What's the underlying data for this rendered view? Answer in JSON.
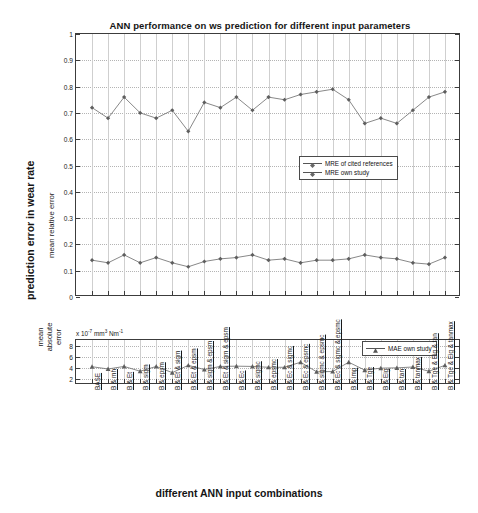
{
  "figure": {
    "title": "ANN performance on ws prediction for different input parameters",
    "xlabel": "different ANN input combinations",
    "ylabel_outer": "prediction error in wear rate",
    "ylabel_top": "mean relative error",
    "ylabel_bottom": "mean\nabsolute\nerror",
    "ylabel_bottom_line1": "mean",
    "ylabel_bottom_line2": "absolute",
    "ylabel_bottom_line3": "error",
    "sci_prefix": "x 10",
    "sci_exp": "-7",
    "sci_unit_a": "mm",
    "sci_unit_a_exp": "3",
    "sci_unit_b": "Nm",
    "sci_unit_b_exp": "-1"
  },
  "legend_top": {
    "items": [
      {
        "label": "MRE of cited references",
        "marker": "diamond",
        "color": "#666666"
      },
      {
        "label": "MRE own study",
        "marker": "diamond",
        "color": "#666666"
      }
    ]
  },
  "legend_bottom": {
    "items": [
      {
        "label": "MAE own study",
        "marker": "triangle",
        "color": "#555555"
      }
    ]
  },
  "axes": {
    "top": {
      "yticks": [
        "0",
        "0.1",
        "0.2",
        "0.3",
        "0.4",
        "0.5",
        "0.6",
        "0.7",
        "0.8",
        "0.9",
        "1"
      ],
      "ylim": [
        0,
        1
      ],
      "grid": true
    },
    "bottom": {
      "yticks": [
        "2",
        "4",
        "6",
        "8"
      ],
      "ylim": [
        1,
        9
      ],
      "grid": true
    }
  },
  "chart_data": {
    "type": "line",
    "title": "ANN performance on ws prediction for different input parameters",
    "xlabel": "different ANN input combinations",
    "ylabel": "prediction error in wear rate",
    "grid": true,
    "legend_position": "inside-right",
    "categories": [
      "BASE",
      "B & mh",
      "B & Et",
      "B & sigm",
      "B & epsm",
      "B & Et & sigm",
      "B & Et & epsm",
      "B & sigm & epsm",
      "B & Et & sigm & epsm",
      "B & Ec",
      "B & sigmc",
      "B & epsmc",
      "B & Ec & sigmc",
      "B & Ec & epsmc",
      "B & sigmc & epsmc",
      "B & Ec & sigmc & epsmc",
      "B & imp",
      "B & Tge",
      "B & Eig",
      "B & tan",
      "B & tanmax",
      "B & Tge & Eig & tan",
      "B & Tge & Eig & tanmax"
    ],
    "panels": [
      {
        "name": "mean relative error",
        "ylabel": "mean relative error",
        "ylim": [
          0,
          1
        ],
        "yticks": [
          0,
          0.1,
          0.2,
          0.3,
          0.4,
          0.5,
          0.6,
          0.7,
          0.8,
          0.9,
          1
        ],
        "series": [
          {
            "name": "MRE of cited references",
            "values": [
              0.72,
              0.68,
              0.76,
              0.7,
              0.68,
              0.71,
              0.63,
              0.74,
              0.72,
              0.76,
              0.71,
              0.76,
              0.75,
              0.77,
              0.78,
              0.79,
              0.75,
              0.66,
              0.68,
              0.66,
              0.71,
              0.76,
              0.78
            ]
          },
          {
            "name": "MRE own study",
            "values": [
              0.14,
              0.13,
              0.16,
              0.13,
              0.15,
              0.13,
              0.115,
              0.135,
              0.145,
              0.15,
              0.16,
              0.14,
              0.145,
              0.13,
              0.14,
              0.14,
              0.145,
              0.16,
              0.15,
              0.145,
              0.13,
              0.125,
              0.15
            ]
          }
        ]
      },
      {
        "name": "mean absolute error",
        "ylabel": "mean absolute error",
        "unit": "x 10^-7 mm^3 Nm^-1",
        "ylim": [
          1,
          9
        ],
        "yticks": [
          2,
          4,
          6,
          8
        ],
        "series": [
          {
            "name": "MAE own study",
            "values": [
              4.25,
              3.85,
              4.3,
              3.45,
              4.3,
              3.2,
              4.5,
              3.75,
              4.3,
              4.35,
              4.3,
              4.15,
              4.15,
              5.05,
              3.35,
              3.4,
              5.05,
              3.65,
              4.0,
              4.05,
              4.2,
              3.45,
              4.5
            ]
          }
        ]
      }
    ]
  }
}
